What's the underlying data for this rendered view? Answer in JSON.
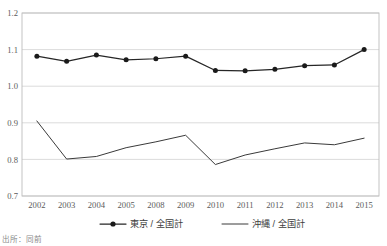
{
  "chart_data": {
    "type": "line",
    "title": "",
    "subtitle": "",
    "xlabel": "",
    "ylabel": "",
    "categories": [
      "2002",
      "2003",
      "2004",
      "2005",
      "2008",
      "2009",
      "2010",
      "2011",
      "2012",
      "2013",
      "2014",
      "2015"
    ],
    "ylim": [
      0.7,
      1.2
    ],
    "yticks": [
      "0.7",
      "0.8",
      "0.9",
      "1.0",
      "1.1",
      "1.2"
    ],
    "ytick_values": [
      0.7,
      0.8,
      0.9,
      1.0,
      1.1,
      1.2
    ],
    "grid": true,
    "legend_position": "bottom",
    "series": [
      {
        "name": "東京 / 全国計",
        "marker": "filled-circle",
        "values": [
          1.082,
          1.068,
          1.085,
          1.072,
          1.075,
          1.082,
          1.043,
          1.042,
          1.046,
          1.056,
          1.058,
          1.1
        ]
      },
      {
        "name": "沖縄 / 全国計",
        "marker": "none",
        "values": [
          0.905,
          0.801,
          0.808,
          0.832,
          0.848,
          0.866,
          0.786,
          0.812,
          0.829,
          0.845,
          0.84,
          0.858
        ]
      }
    ],
    "source_note": "出所：同前"
  },
  "legend": {
    "entries": [
      {
        "label": "東京 / 全国計",
        "style": "line-with-marker"
      },
      {
        "label": "沖縄 / 全国計",
        "style": "line-only"
      }
    ]
  },
  "colors": {
    "tokyo_line": "#262626",
    "okinawa_line": "#3a3a3a",
    "gridline": "#d2d2d2",
    "frame": "#bdbdbd",
    "tick_text": "#5a5a5a",
    "legend_text": "#3d3d3d",
    "source_text": "#8a8a8a",
    "background": "#ffffff"
  },
  "geometry": {
    "plot_left": 22,
    "plot_right": 379,
    "plot_top": 13,
    "plot_bottom": 196
  }
}
